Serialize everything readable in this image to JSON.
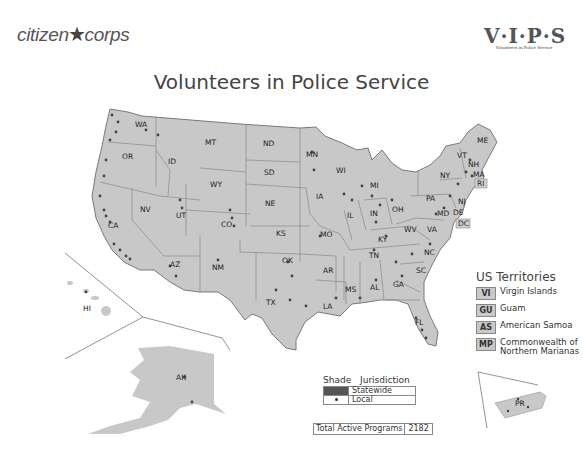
{
  "header": {
    "logo_left": {
      "text_a": "citizen",
      "text_b": "corps",
      "icon": "star-icon"
    },
    "logo_right": {
      "text": "V·I·P·S",
      "subtitle": "Volunteers in Police Service"
    },
    "title": "Volunteers in Police Service"
  },
  "map": {
    "fill_color": "#c8c8c8",
    "border_color": "#7a7a7a",
    "dot_color": "#444444",
    "state_labels": [
      {
        "code": "WA",
        "x": 135,
        "y": 127
      },
      {
        "code": "OR",
        "x": 122,
        "y": 159
      },
      {
        "code": "ID",
        "x": 168,
        "y": 164
      },
      {
        "code": "MT",
        "x": 205,
        "y": 145
      },
      {
        "code": "WY",
        "x": 217,
        "y": 187
      },
      {
        "code": "ND",
        "x": 269,
        "y": 146
      },
      {
        "code": "SD",
        "x": 270,
        "y": 175
      },
      {
        "code": "NE",
        "x": 271,
        "y": 206
      },
      {
        "code": "MN",
        "x": 306,
        "y": 157
      },
      {
        "code": "WI",
        "x": 339,
        "y": 173
      },
      {
        "code": "IA",
        "x": 316,
        "y": 199
      },
      {
        "code": "NV",
        "x": 144,
        "y": 209
      },
      {
        "code": "UT",
        "x": 180,
        "y": 216
      },
      {
        "code": "CO",
        "x": 228,
        "y": 225
      },
      {
        "code": "KS",
        "x": 280,
        "y": 236
      },
      {
        "code": "MO",
        "x": 322,
        "y": 235
      },
      {
        "code": "CA",
        "x": 110,
        "y": 225
      },
      {
        "code": "AZ",
        "x": 174,
        "y": 265
      },
      {
        "code": "NM",
        "x": 217,
        "y": 268
      },
      {
        "code": "OK",
        "x": 286,
        "y": 262
      },
      {
        "code": "AR",
        "x": 327,
        "y": 271
      },
      {
        "code": "TX",
        "x": 270,
        "y": 305
      },
      {
        "code": "LA",
        "x": 327,
        "y": 308
      },
      {
        "code": "MS",
        "x": 349,
        "y": 290
      },
      {
        "code": "AL",
        "x": 373,
        "y": 289
      },
      {
        "code": "GA",
        "x": 398,
        "y": 285
      },
      {
        "code": "FL",
        "x": 419,
        "y": 324
      },
      {
        "code": "SC",
        "x": 419,
        "y": 271
      },
      {
        "code": "NC",
        "x": 428,
        "y": 253
      },
      {
        "code": "TN",
        "x": 372,
        "y": 257
      },
      {
        "code": "KY",
        "x": 381,
        "y": 240
      },
      {
        "code": "IN",
        "x": 372,
        "y": 214
      },
      {
        "code": "IL",
        "x": 350,
        "y": 217
      },
      {
        "code": "OH",
        "x": 395,
        "y": 210
      },
      {
        "code": "MI",
        "x": 373,
        "y": 186
      },
      {
        "code": "WV",
        "x": 410,
        "y": 229
      },
      {
        "code": "VA",
        "x": 432,
        "y": 231
      },
      {
        "code": "PA",
        "x": 430,
        "y": 200
      },
      {
        "code": "NY",
        "x": 441,
        "y": 176
      },
      {
        "code": "MD",
        "x": 440,
        "y": 215
      },
      {
        "code": "DE",
        "x": 456,
        "y": 214
      },
      {
        "code": "NJ",
        "x": 459,
        "y": 203
      },
      {
        "code": "VT",
        "x": 463,
        "y": 158
      },
      {
        "code": "NH",
        "x": 473,
        "y": 167
      },
      {
        "code": "MA",
        "x": 478,
        "y": 176
      },
      {
        "code": "ME",
        "x": 480,
        "y": 142
      },
      {
        "code": "HI",
        "x": 85,
        "y": 310
      },
      {
        "code": "AK",
        "x": 180,
        "y": 379
      },
      {
        "code": "PR",
        "x": 525,
        "y": 404
      }
    ],
    "boxed_labels": [
      {
        "code": "RI",
        "x": 479,
        "y": 184
      },
      {
        "code": "DC",
        "x": 460,
        "y": 225
      }
    ]
  },
  "territories": {
    "title": "US Territories",
    "items": [
      {
        "code": "VI",
        "name": "Virgin Islands"
      },
      {
        "code": "GU",
        "name": "Guam"
      },
      {
        "code": "AS",
        "name": "American Samoa"
      },
      {
        "code": "MP",
        "name": "Commonwealth of Northern Marianas"
      }
    ]
  },
  "legend": {
    "col_shade": "Shade",
    "col_jurisdiction": "Jurisdiction",
    "rows": [
      {
        "symbol": "shade",
        "label": "Statewide",
        "color": "#555555"
      },
      {
        "symbol": "dot",
        "label": "Local",
        "color": "#333333"
      }
    ]
  },
  "total": {
    "label": "Total Active Programs",
    "value": "2182"
  }
}
